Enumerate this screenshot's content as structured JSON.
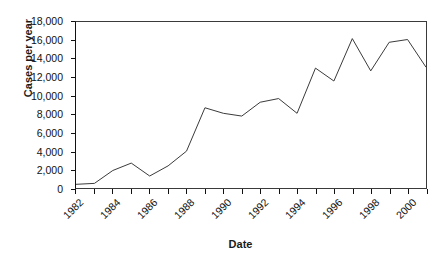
{
  "chart_data": {
    "type": "line",
    "title": "",
    "xlabel": "Date",
    "ylabel": "Cases per year",
    "x": [
      1982,
      1983,
      1984,
      1985,
      1986,
      1987,
      1988,
      1989,
      1990,
      1991,
      1992,
      1993,
      1994,
      1995,
      1996,
      1997,
      1998,
      1999,
      2000,
      2001
    ],
    "values": [
      400,
      500,
      1900,
      2700,
      1300,
      2400,
      4000,
      8700,
      8100,
      7800,
      9300,
      9700,
      8100,
      13000,
      11600,
      16200,
      12700,
      15800,
      16100,
      13100
    ],
    "series": [
      {
        "name": "Cases per year",
        "values": [
          400,
          500,
          1900,
          2700,
          1300,
          2400,
          4000,
          8700,
          8100,
          7800,
          9300,
          9700,
          8100,
          13000,
          11600,
          16200,
          12700,
          15800,
          16100,
          13100
        ]
      }
    ],
    "xlim": [
      1982,
      2001
    ],
    "ylim": [
      0,
      18000
    ],
    "ytick_labels": [
      "0",
      "2,000",
      "4,000",
      "6,000",
      "8,000",
      "10,000",
      "12,000",
      "14,000",
      "16,000",
      "18,000"
    ],
    "ytick_values": [
      0,
      2000,
      4000,
      6000,
      8000,
      10000,
      12000,
      14000,
      16000,
      18000
    ],
    "xtick_labels": [
      "1982",
      "1984",
      "1986",
      "1988",
      "1990",
      "1992",
      "1994",
      "1996",
      "1998",
      "2000"
    ],
    "xtick_values": [
      1982,
      1984,
      1986,
      1988,
      1990,
      1992,
      1994,
      1996,
      1998,
      2000
    ],
    "grid": false,
    "legend": "none",
    "line_color": "#3b3b3b",
    "background_color": "#ffffff",
    "axis_color": "#111111"
  }
}
